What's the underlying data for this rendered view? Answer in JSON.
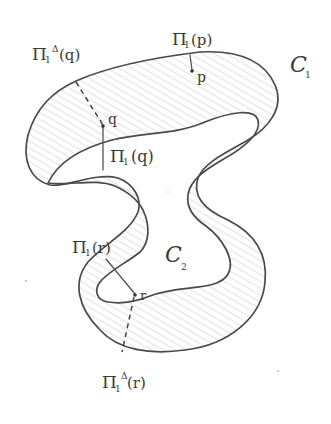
{
  "diagram": {
    "type": "hand-drawn sketch",
    "curves": {
      "outer": {
        "label": "C",
        "subscript": "1"
      },
      "inner": {
        "label": "C",
        "subscript": "2"
      }
    },
    "points": [
      {
        "id": "p",
        "label": "p"
      },
      {
        "id": "q",
        "label": "q"
      },
      {
        "id": "r",
        "label": "r"
      }
    ],
    "labels": {
      "pi_p": {
        "main": "Π",
        "sub": "1",
        "arg": "(p)"
      },
      "pi_delta_q": {
        "main": "Π",
        "sub": "1",
        "sup": "Δ",
        "arg": "(q)"
      },
      "pi_q": {
        "main": "Π",
        "sub": "1",
        "arg": "(q)"
      },
      "pi_r": {
        "main": "Π",
        "sub": "1",
        "arg": "(r)"
      },
      "pi_delta_r": {
        "main": "Π",
        "sub": "1",
        "sup": "Δ",
        "arg": "(r)"
      }
    },
    "segments": [
      {
        "from": "p",
        "to": "pi_p",
        "style": "solid"
      },
      {
        "from": "q",
        "to": "pi_delta_q",
        "style": "dashed"
      },
      {
        "from": "q",
        "to": "pi_q",
        "style": "solid"
      },
      {
        "from": "r",
        "to": "pi_r",
        "style": "solid"
      },
      {
        "from": "r",
        "to": "pi_delta_r",
        "style": "dashed"
      }
    ],
    "colors": {
      "ink": "#4a4a4a",
      "hatch": "#bdbdbd",
      "background": "#ffffff"
    }
  }
}
